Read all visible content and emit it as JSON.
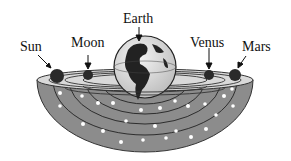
{
  "diagram": {
    "labels": {
      "sun": "Sun",
      "moon": "Moon",
      "earth": "Earth",
      "venus": "Venus",
      "mars": "Mars"
    },
    "colors": {
      "bowl": "#8a8a8a",
      "bowl_dark": "#6e6e6e",
      "rim": "#d8d8d8",
      "planet": "#2a2a2a",
      "star": "#ffffff",
      "text": "#111111"
    }
  }
}
